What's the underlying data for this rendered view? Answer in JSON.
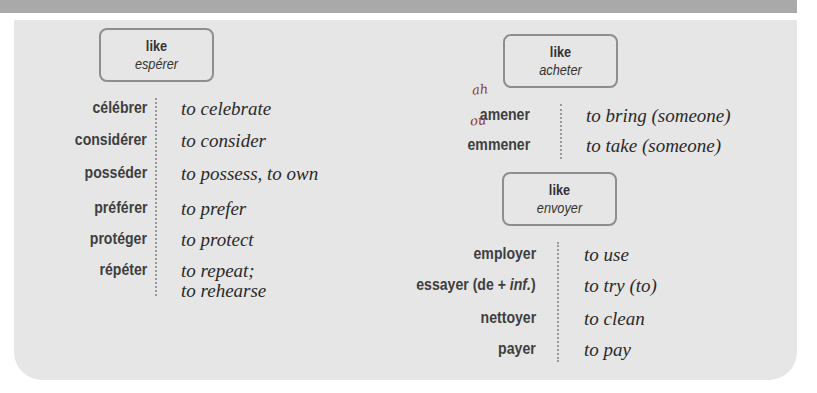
{
  "groups": [
    {
      "box": {
        "line1": "like",
        "line2": "espérer"
      },
      "rows": [
        {
          "verb": "célébrer",
          "translation": "to celebrate"
        },
        {
          "verb": "considérer",
          "translation": "to consider"
        },
        {
          "verb": "posséder",
          "translation": "to possess, to own"
        },
        {
          "verb": "préférer",
          "translation": "to prefer"
        },
        {
          "verb": "protéger",
          "translation": "to protect"
        },
        {
          "verb": "répéter",
          "translation": "to repeat;",
          "translation2": "to rehearse"
        }
      ]
    },
    {
      "box": {
        "line1": "like",
        "line2": "acheter"
      },
      "rows": [
        {
          "verb": "amener",
          "translation": "to bring (someone)",
          "annotation": "ah"
        },
        {
          "verb": "emmener",
          "translation": "to take (someone)",
          "annotation": "ou"
        }
      ]
    },
    {
      "box": {
        "line1": "like",
        "line2": "envoyer"
      },
      "rows": [
        {
          "verb": "employer",
          "translation": "to use"
        },
        {
          "verb": "essayer (de + ",
          "verb_italic": "inf.",
          "verb_end": ")",
          "translation": "to try (to)"
        },
        {
          "verb": "nettoyer",
          "translation": "to clean"
        },
        {
          "verb": "payer",
          "translation": "to pay"
        }
      ]
    }
  ],
  "colors": {
    "panel": "#e6e6e6",
    "band": "#a9a9a9",
    "box_border": "#8e8e8e",
    "verb_text": "#3e3e3e"
  }
}
